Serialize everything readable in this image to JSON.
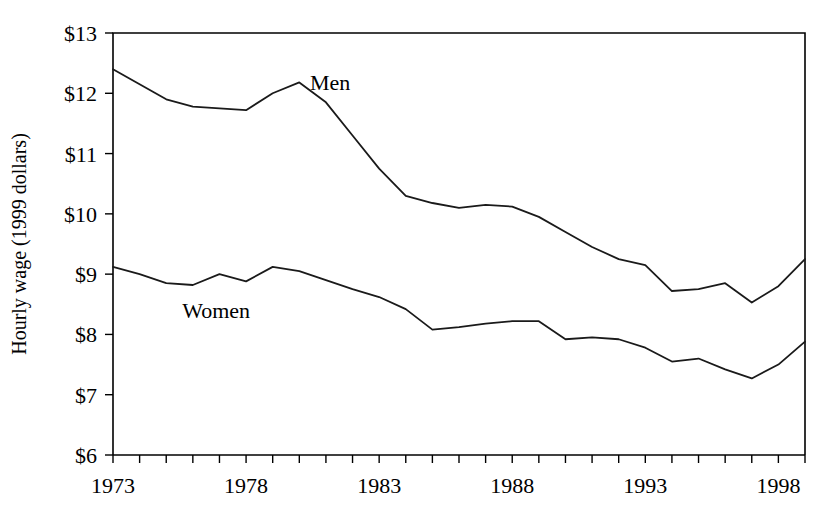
{
  "chart_data": {
    "type": "line",
    "title": "",
    "subtitle": "",
    "xlabel": "",
    "ylabel": "Hourly wage (1999 dollars)",
    "xlim": [
      1973,
      1999
    ],
    "ylim": [
      6,
      13
    ],
    "grid": false,
    "legend_position": "inline-annotation",
    "x": [
      1973,
      1974,
      1975,
      1976,
      1977,
      1978,
      1979,
      1980,
      1981,
      1982,
      1983,
      1984,
      1985,
      1986,
      1987,
      1988,
      1989,
      1990,
      1991,
      1992,
      1993,
      1994,
      1995,
      1996,
      1997,
      1998,
      1999
    ],
    "y_tick_values": [
      6,
      7,
      8,
      9,
      10,
      11,
      12,
      13
    ],
    "y_tick_labels": [
      "$6",
      "$7",
      "$8",
      "$9",
      "$10",
      "$11",
      "$12",
      "$13"
    ],
    "x_tick_values": [
      1973,
      1974,
      1975,
      1976,
      1977,
      1978,
      1979,
      1980,
      1981,
      1982,
      1983,
      1984,
      1985,
      1986,
      1987,
      1988,
      1989,
      1990,
      1991,
      1992,
      1993,
      1994,
      1995,
      1996,
      1997,
      1998,
      1999
    ],
    "x_labeled_ticks": [
      {
        "value": 1973,
        "label": "1973"
      },
      {
        "value": 1978,
        "label": "1978"
      },
      {
        "value": 1983,
        "label": "1983"
      },
      {
        "value": 1988,
        "label": "1988"
      },
      {
        "value": 1993,
        "label": "1993"
      },
      {
        "value": 1998,
        "label": "1998"
      }
    ],
    "series": [
      {
        "name": "Men",
        "annotation_label": "Men",
        "annotation_x": 1980.4,
        "annotation_y": 12.06,
        "color": "#1a1a1a",
        "values": [
          12.4,
          12.15,
          11.9,
          11.78,
          11.75,
          11.72,
          12.0,
          12.18,
          11.85,
          11.3,
          10.75,
          10.3,
          10.18,
          10.1,
          10.15,
          10.12,
          9.95,
          9.7,
          9.45,
          9.25,
          9.15,
          8.72,
          8.75,
          8.85,
          8.53,
          8.8,
          9.25
        ]
      },
      {
        "name": "Women",
        "annotation_label": "Women",
        "annotation_x": 1975.6,
        "annotation_y": 8.27,
        "color": "#1a1a1a",
        "values": [
          9.12,
          9.0,
          8.85,
          8.82,
          9.0,
          8.88,
          9.12,
          9.05,
          8.9,
          8.75,
          8.62,
          8.42,
          8.08,
          8.12,
          8.18,
          8.22,
          8.22,
          7.92,
          7.95,
          7.92,
          7.78,
          7.55,
          7.6,
          7.42,
          7.27,
          7.5,
          7.88
        ]
      }
    ]
  }
}
